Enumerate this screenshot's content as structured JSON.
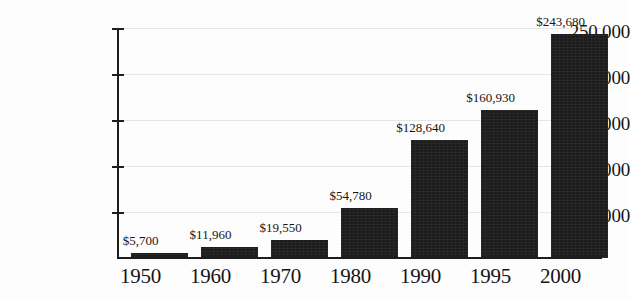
{
  "chart_data": {
    "type": "bar",
    "title": "",
    "subtitle": "",
    "xlabel": "",
    "ylabel": "",
    "categories": [
      "1950",
      "1960",
      "1970",
      "1980",
      "1990",
      "1995",
      "2000"
    ],
    "values": [
      5700,
      11960,
      19550,
      54780,
      128640,
      160930,
      243680
    ],
    "data_labels": [
      "$5,700",
      "$11,960",
      "$19,550",
      "$54,780",
      "$128,640",
      "$160,930",
      "$243,680"
    ],
    "ylim": [
      0,
      250000
    ],
    "ytick_values": [
      50000,
      100000,
      150000,
      200000,
      250000
    ],
    "ytick_labels": [
      "50,000",
      "100,000",
      "150,000",
      "200,000",
      "250,000"
    ],
    "grid": true,
    "grid_axis": "y",
    "legend": false,
    "legend_position": "none",
    "bar_color": "#1c1c1c",
    "gridline_color": "#e6e6e6",
    "axis_color": "#1d1d1d",
    "background_color": "#fdfdfd",
    "text_color": "#151515"
  }
}
